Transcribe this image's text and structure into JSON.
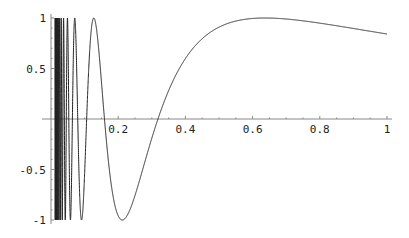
{
  "chart_data": {
    "type": "line",
    "title": "",
    "xlabel": "",
    "ylabel": "",
    "function": "sin(1/x)",
    "xlim": [
      0,
      1
    ],
    "ylim": [
      -1,
      1
    ],
    "grid": false,
    "x_ticks": [
      {
        "value": 0.2,
        "label": "0.2"
      },
      {
        "value": 0.4,
        "label": "0.4"
      },
      {
        "value": 0.6,
        "label": "0.6"
      },
      {
        "value": 0.8,
        "label": "0.8"
      },
      {
        "value": 1,
        "label": "1"
      }
    ],
    "y_ticks": [
      {
        "value": 1,
        "label": "1"
      },
      {
        "value": 0.5,
        "label": "0.5"
      },
      {
        "value": -0.5,
        "label": "-0.5"
      },
      {
        "value": -1,
        "label": "-1"
      }
    ],
    "series": [
      {
        "name": "sin(1/x)",
        "color": "#222222",
        "key_points": [
          {
            "x": 0.212,
            "y": -1
          },
          {
            "x": 0.318,
            "y": 0
          },
          {
            "x": 0.637,
            "y": 1
          },
          {
            "x": 1.0,
            "y": 0.841
          }
        ]
      }
    ]
  }
}
